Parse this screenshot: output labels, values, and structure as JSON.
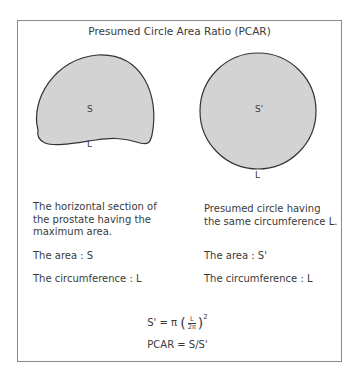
{
  "title": "Presumed Circle Area Ratio (PCAR)",
  "left_shape": {
    "area_label": "S",
    "perimeter_label": "L",
    "description": "The horizontal section of the prostate having the maximum area.",
    "description_lines": [
      "The horizontal section of",
      "the prostate having the",
      "maximum area."
    ],
    "area_text": "The area : S",
    "circumference_text": "The circumference : L"
  },
  "right_shape": {
    "area_label": "S'",
    "perimeter_label": "L",
    "description_lines": [
      "Presumed circle having",
      "the same circumference L."
    ],
    "area_text": "The area : S'",
    "circumference_text": "The circumference : L"
  },
  "formula": {
    "lhs": "S' = π",
    "frac_num": "L",
    "frac_den": "2π",
    "exponent": "2",
    "pcar": "PCAR = S/S'"
  },
  "colors": {
    "shape_fill": "#d3d3d3",
    "shape_stroke": "#333333",
    "border": "#8a8a8a",
    "text": "#3a3a3a"
  }
}
